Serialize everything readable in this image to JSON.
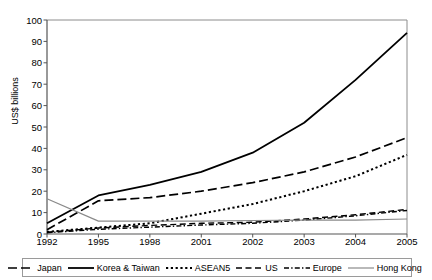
{
  "chart_data": {
    "type": "line",
    "title": "",
    "xlabel": "",
    "ylabel": "US$ billions",
    "categories": [
      "1992",
      "1995",
      "1998",
      "2001",
      "2002",
      "2003",
      "2004",
      "2005"
    ],
    "ylim": [
      0,
      100
    ],
    "ytick_values": [
      0,
      10,
      20,
      30,
      40,
      50,
      60,
      70,
      80,
      90,
      100
    ],
    "grid": false,
    "legend_position": "bottom",
    "series": [
      {
        "name": "Japan",
        "style": "dashed",
        "color": "#000000",
        "values": [
          2.0,
          15.5,
          17.0,
          20.0,
          24.0,
          29.0,
          36.0,
          45.0
        ]
      },
      {
        "name": "Korea & Taiwan",
        "style": "solid",
        "color": "#000000",
        "values": [
          5.0,
          18.0,
          23.0,
          29.0,
          38.0,
          52.0,
          72.0,
          94.0
        ]
      },
      {
        "name": "ASEAN5",
        "style": "dotted",
        "color": "#000000",
        "values": [
          1.0,
          3.0,
          5.0,
          9.5,
          14.0,
          20.0,
          27.0,
          37.0
        ]
      },
      {
        "name": "US",
        "style": "long-dash",
        "color": "#000000",
        "values": [
          0.8,
          2.8,
          4.0,
          5.0,
          5.5,
          7.0,
          9.0,
          11.5
        ]
      },
      {
        "name": "Europe",
        "style": "dash-dot",
        "color": "#000000",
        "values": [
          0.6,
          2.2,
          3.2,
          4.2,
          5.0,
          6.5,
          8.5,
          11.0
        ]
      },
      {
        "name": "Hong Kong",
        "style": "thin-solid",
        "color": "#8a8a8a",
        "values": [
          16.5,
          6.0,
          6.0,
          6.0,
          6.3,
          6.5,
          6.5,
          7.0
        ]
      }
    ]
  },
  "axis": {
    "y_label": "US$ billions",
    "y_ticks": [
      "100",
      "90",
      "80",
      "70",
      "60",
      "50",
      "40",
      "30",
      "20",
      "10",
      "0"
    ],
    "x_ticks": [
      "1992",
      "1995",
      "1998",
      "2001",
      "2002",
      "2003",
      "2004",
      "2005"
    ]
  },
  "legend": {
    "items": [
      {
        "label": "Japan"
      },
      {
        "label": "Korea & Taiwan"
      },
      {
        "label": "ASEAN5"
      },
      {
        "label": "US"
      },
      {
        "label": "Europe"
      },
      {
        "label": "Hong Kong"
      }
    ]
  }
}
